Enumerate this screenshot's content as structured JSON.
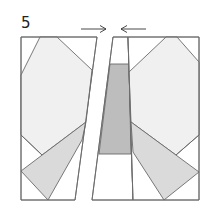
{
  "diagram": {
    "step_number": "5",
    "colors": {
      "outline": "#6a6a6a",
      "light_fill": "#f0f0f0",
      "medium_fill": "#dadada",
      "dark_fill": "#bdbdbd",
      "background": "#ffffff",
      "arrow": "#333333"
    },
    "arrows": [
      {
        "direction": "right",
        "label": "join-arrow-left"
      },
      {
        "direction": "left",
        "label": "join-arrow-right"
      }
    ],
    "sections": [
      {
        "name": "left-section"
      },
      {
        "name": "center-strip"
      },
      {
        "name": "right-section"
      }
    ]
  }
}
